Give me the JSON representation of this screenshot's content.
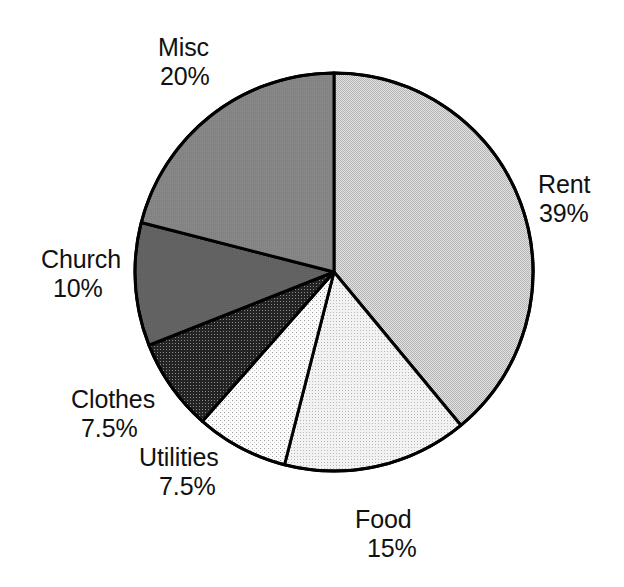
{
  "chart_data": {
    "type": "pie",
    "title": "",
    "subtitle": "",
    "xlabel": "",
    "ylabel": "",
    "legend_position": "none",
    "grid": false,
    "labels_on_slices": false,
    "label_format": "name + percent",
    "start_angle_deg": 0,
    "direction": "clockwise",
    "total_percent": 99,
    "categories": [
      "Rent",
      "Food",
      "Utilities",
      "Clothes",
      "Church",
      "Misc"
    ],
    "values": [
      39,
      15,
      7.5,
      7.5,
      10,
      20
    ],
    "slices": [
      {
        "name": "Rent",
        "value": 39,
        "value_text": "39%",
        "label_line1": "Rent",
        "label_line2": "39%",
        "fill": "#d2d2d2",
        "pattern": "fine-checker-light",
        "start_deg": 0,
        "end_deg": 140.4,
        "label_anchor": "right"
      },
      {
        "name": "Food",
        "value": 15,
        "value_text": "15%",
        "label_line1": "Food",
        "label_line2": "15%",
        "fill": "#ededed",
        "pattern": "fine-dots-very-light",
        "start_deg": 140.4,
        "end_deg": 194.4,
        "label_anchor": "bottom"
      },
      {
        "name": "Utilities",
        "value": 7.5,
        "value_text": "7.5%",
        "label_line1": "Utilities",
        "label_line2": "7.5%",
        "fill": "#f6f6f6",
        "pattern": "sparse-dots-white",
        "start_deg": 194.4,
        "end_deg": 221.4,
        "label_anchor": "bottom-left"
      },
      {
        "name": "Clothes",
        "value": 7.5,
        "value_text": "7.5%",
        "label_line1": "Clothes",
        "label_line2": "7.5%",
        "fill": "#3a3a3a",
        "pattern": "dark-stipple",
        "start_deg": 221.4,
        "end_deg": 248.4,
        "label_anchor": "left"
      },
      {
        "name": "Church",
        "value": 10,
        "value_text": "10%",
        "label_line1": "Church",
        "label_line2": "10%",
        "fill": "#646464",
        "pattern": "mid-dark-gray",
        "start_deg": 248.4,
        "end_deg": 284.4,
        "label_anchor": "left"
      },
      {
        "name": "Misc",
        "value": 20,
        "value_text": "20%",
        "label_line1": "Misc",
        "label_line2": "20%",
        "fill": "#858585",
        "pattern": "mid-gray",
        "start_deg": 284.4,
        "end_deg": 360,
        "label_anchor": "top-left"
      }
    ],
    "geometry": {
      "center_x": 334,
      "center_y": 272,
      "radius": 199,
      "outline_color": "#000000",
      "outline_width": 3
    }
  }
}
